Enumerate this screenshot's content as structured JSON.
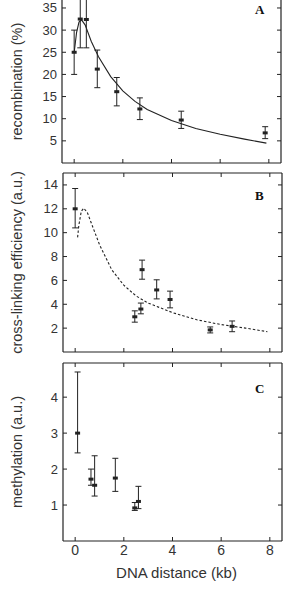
{
  "figure": {
    "xlabel": "DNA distance (kb)",
    "x_ticks": [
      0,
      2,
      4,
      6,
      8
    ],
    "x_tick_labels": [
      "0",
      "2",
      "4",
      "6",
      "8"
    ]
  },
  "chart_data": [
    {
      "type": "scatter",
      "panel": "A",
      "title": "",
      "xlabel": "DNA distance (kb)",
      "ylabel": "recombination (%)",
      "xlim": [
        -0.5,
        8.5
      ],
      "ylim": [
        0,
        36.8
      ],
      "y_ticks": [
        5,
        10,
        15,
        20,
        25,
        30,
        35
      ],
      "y_tick_labels": [
        "5",
        "10",
        "15",
        "20",
        "25",
        "30",
        "35"
      ],
      "grid": false,
      "points": [
        {
          "x": 0.0,
          "y": 25.0,
          "err_low": 20.0,
          "err_high": 30.0
        },
        {
          "x": 0.25,
          "y": 32.5,
          "err_low": 26.0,
          "err_high": 38.0
        },
        {
          "x": 0.5,
          "y": 32.4,
          "err_low": 26.0,
          "err_high": 38.0
        },
        {
          "x": 0.95,
          "y": 21.2,
          "err_low": 17.0,
          "err_high": 25.5
        },
        {
          "x": 1.75,
          "y": 16.1,
          "err_low": 12.9,
          "err_high": 19.3
        },
        {
          "x": 2.7,
          "y": 12.2,
          "err_low": 9.8,
          "err_high": 14.7
        },
        {
          "x": 4.4,
          "y": 9.7,
          "err_low": 7.8,
          "err_high": 11.7
        },
        {
          "x": 7.85,
          "y": 6.8,
          "err_low": 5.5,
          "err_high": 8.2
        }
      ],
      "fit_curve": {
        "style": "solid",
        "x": [
          0.0,
          0.1,
          0.2,
          0.3,
          0.45,
          0.7,
          1.0,
          1.5,
          2.0,
          2.5,
          3.0,
          4.0,
          5.0,
          6.0,
          7.0,
          7.9
        ],
        "y": [
          25.0,
          29.5,
          31.8,
          32.3,
          31.2,
          27.5,
          24.0,
          19.5,
          16.3,
          13.9,
          12.1,
          9.6,
          7.8,
          6.5,
          5.4,
          4.5
        ]
      }
    },
    {
      "type": "scatter",
      "panel": "B",
      "title": "",
      "xlabel": "DNA distance (kb)",
      "ylabel": "cross-linking efficiency (a.u.)",
      "xlim": [
        -0.5,
        8.5
      ],
      "ylim": [
        0,
        15.0
      ],
      "y_ticks": [
        2,
        4,
        6,
        8,
        10,
        12,
        14
      ],
      "y_tick_labels": [
        "2",
        "4",
        "6",
        "8",
        "10",
        "12",
        "14"
      ],
      "grid": false,
      "points": [
        {
          "x": 0.0,
          "y": 12.0,
          "err_low": 10.4,
          "err_high": 13.7
        },
        {
          "x": 2.45,
          "y": 2.95,
          "err_low": 2.5,
          "err_high": 3.45
        },
        {
          "x": 2.7,
          "y": 3.6,
          "err_low": 3.2,
          "err_high": 4.1
        },
        {
          "x": 2.75,
          "y": 6.9,
          "err_low": 6.1,
          "err_high": 7.7
        },
        {
          "x": 3.35,
          "y": 5.2,
          "err_low": 4.45,
          "err_high": 6.05
        },
        {
          "x": 3.9,
          "y": 4.4,
          "err_low": 3.7,
          "err_high": 5.1
        },
        {
          "x": 5.55,
          "y": 1.85,
          "err_low": 1.6,
          "err_high": 2.1
        },
        {
          "x": 6.45,
          "y": 2.15,
          "err_low": 1.7,
          "err_high": 2.6
        }
      ],
      "fit_curve": {
        "style": "dashed",
        "x": [
          0.1,
          0.15,
          0.25,
          0.35,
          0.5,
          0.7,
          1.0,
          1.5,
          2.0,
          2.5,
          3.0,
          4.0,
          5.0,
          6.0,
          7.0,
          7.9
        ],
        "y": [
          9.6,
          10.6,
          11.8,
          12.05,
          11.7,
          10.6,
          9.0,
          6.9,
          5.6,
          4.7,
          4.1,
          3.3,
          2.7,
          2.3,
          2.0,
          1.7
        ]
      }
    },
    {
      "type": "scatter",
      "panel": "C",
      "title": "",
      "xlabel": "DNA distance (kb)",
      "ylabel": "methylation (a.u.)",
      "xlim": [
        -0.5,
        8.5
      ],
      "ylim": [
        0,
        4.95
      ],
      "y_ticks": [
        1,
        2,
        3,
        4
      ],
      "y_tick_labels": [
        "1",
        "2",
        "3",
        "4"
      ],
      "grid": false,
      "points": [
        {
          "x": 0.1,
          "y": 3.0,
          "err_low": 2.45,
          "err_high": 4.7
        },
        {
          "x": 0.65,
          "y": 1.72,
          "err_low": 1.55,
          "err_high": 2.0
        },
        {
          "x": 0.8,
          "y": 1.55,
          "err_low": 1.25,
          "err_high": 2.37
        },
        {
          "x": 1.65,
          "y": 1.75,
          "err_low": 1.38,
          "err_high": 2.3
        },
        {
          "x": 2.45,
          "y": 0.92,
          "err_low": 0.85,
          "err_high": 1.07
        },
        {
          "x": 2.6,
          "y": 1.1,
          "err_low": 0.9,
          "err_high": 1.52
        }
      ]
    }
  ],
  "colors": {
    "ink": "#222222",
    "tick_label": "#333333",
    "background": "#ffffff"
  }
}
